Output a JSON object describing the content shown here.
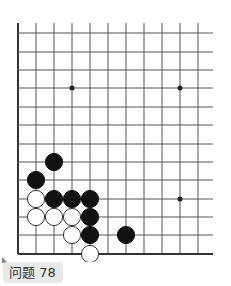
{
  "problem": {
    "label": "问题 78",
    "number": 78
  },
  "board": {
    "grid_x": [
      18,
      36,
      54,
      72,
      90,
      108,
      126,
      144,
      162,
      180,
      198
    ],
    "grid_y": [
      33,
      52,
      70,
      88,
      107,
      125,
      144,
      162,
      180,
      199,
      217,
      235,
      254
    ],
    "line_top": 23,
    "line_right": 213,
    "star_points": [
      [
        3,
        3
      ],
      [
        9,
        3
      ],
      [
        9,
        9
      ]
    ],
    "stones": [
      {
        "color": "black",
        "col": 2,
        "row": 7
      },
      {
        "color": "black",
        "col": 1,
        "row": 8
      },
      {
        "color": "white",
        "col": 1,
        "row": 9
      },
      {
        "color": "black",
        "col": 2,
        "row": 9
      },
      {
        "color": "black",
        "col": 3,
        "row": 9
      },
      {
        "color": "black",
        "col": 4,
        "row": 9
      },
      {
        "color": "white",
        "col": 1,
        "row": 10
      },
      {
        "color": "white",
        "col": 2,
        "row": 10
      },
      {
        "color": "white",
        "col": 3,
        "row": 10
      },
      {
        "color": "black",
        "col": 4,
        "row": 10
      },
      {
        "color": "white",
        "col": 3,
        "row": 11
      },
      {
        "color": "black",
        "col": 4,
        "row": 11
      },
      {
        "color": "black",
        "col": 6,
        "row": 11
      },
      {
        "color": "white",
        "col": 4,
        "row": 12
      }
    ],
    "colors": {
      "line": "#555555",
      "edge": "#333333",
      "black_stone": "#111111",
      "white_stone": "#ffffff",
      "white_stroke": "#333333"
    }
  }
}
